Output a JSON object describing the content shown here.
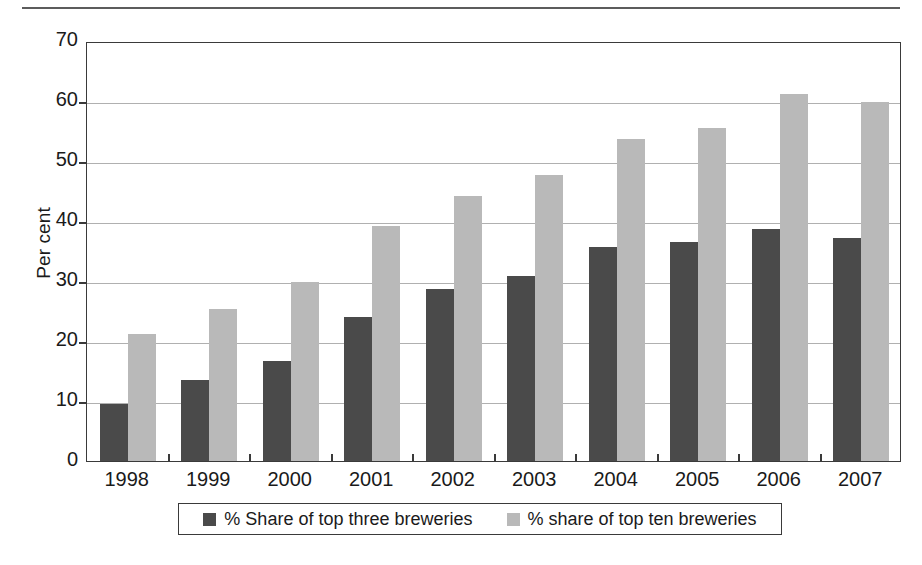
{
  "chart_data": {
    "type": "bar",
    "title": "",
    "subtitle": "",
    "xlabel": "",
    "ylabel": "Per cent",
    "ylim": [
      0,
      70
    ],
    "ytick_step": 10,
    "yticks": [
      0,
      10,
      20,
      30,
      40,
      50,
      60,
      70
    ],
    "grid": true,
    "legend_position": "bottom",
    "categories": [
      "1998",
      "1999",
      "2000",
      "2001",
      "2002",
      "2003",
      "2004",
      "2005",
      "2006",
      "2007"
    ],
    "series": [
      {
        "name": "% Share of top three breweries",
        "color": "#4a4a4a",
        "values": [
          9.5,
          13.5,
          16.7,
          24.0,
          28.6,
          30.8,
          35.7,
          36.5,
          38.7,
          37.2
        ]
      },
      {
        "name": "% share of top ten breweries",
        "color": "#b9b9b9",
        "values": [
          21.1,
          25.4,
          29.9,
          39.2,
          44.2,
          47.7,
          53.7,
          55.5,
          61.2,
          59.9
        ]
      }
    ]
  },
  "legend": {
    "items": [
      {
        "label": "% Share of top three breweries",
        "swatch": "dark-square-icon"
      },
      {
        "label": "% share of top ten breweries",
        "swatch": "light-square-icon"
      }
    ]
  },
  "axes": {
    "y_title": "Per cent"
  }
}
